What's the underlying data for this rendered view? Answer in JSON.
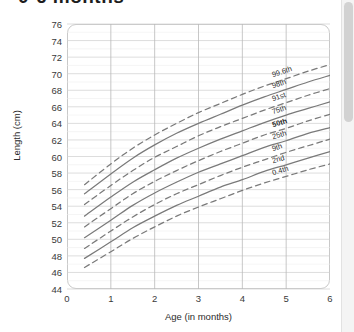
{
  "page": {
    "title": "0-6 months",
    "background_color": "#ffffff"
  },
  "scrollbar": {
    "name": "vertical-scrollbar",
    "thumb_color": "#d2d2d2",
    "track_color": "#f4f4f4"
  },
  "chart_data": {
    "type": "line",
    "title": "0-6 months",
    "xlabel": "Age (in months)",
    "ylabel": "Length (cm)",
    "xlim": [
      0,
      6
    ],
    "ylim": [
      44,
      76
    ],
    "xticks": [
      0,
      1,
      2,
      3,
      4,
      5,
      6
    ],
    "yticks": [
      44,
      46,
      48,
      50,
      52,
      54,
      56,
      58,
      60,
      62,
      64,
      66,
      68,
      70,
      72,
      74,
      76
    ],
    "grid": true,
    "grid_minor_y_step": 1,
    "legend_position": "inline-right-of-curves",
    "line_color": "#7a7a7a",
    "x": [
      0.4,
      1,
      1.5,
      2,
      2.5,
      3,
      3.5,
      4,
      4.5,
      5,
      5.5,
      6
    ],
    "series": [
      {
        "name": "99.6th",
        "label": "99.6th",
        "style": "dashed",
        "values": [
          56.6,
          59.1,
          61.0,
          62.6,
          64.0,
          65.3,
          66.4,
          67.5,
          68.5,
          69.4,
          70.3,
          71.1
        ]
      },
      {
        "name": "98th",
        "label": "98th",
        "style": "solid",
        "values": [
          55.5,
          57.9,
          59.8,
          61.4,
          62.8,
          64.0,
          65.1,
          66.2,
          67.2,
          68.1,
          69.0,
          69.8
        ]
      },
      {
        "name": "91st",
        "label": "91st",
        "style": "dashed",
        "values": [
          54.2,
          56.5,
          58.3,
          59.9,
          61.2,
          62.5,
          63.6,
          64.6,
          65.6,
          66.5,
          67.4,
          68.2
        ]
      },
      {
        "name": "75th",
        "label": "75th",
        "style": "solid",
        "values": [
          52.8,
          55.1,
          56.9,
          58.4,
          59.8,
          61.0,
          62.1,
          63.1,
          64.1,
          65.0,
          65.8,
          66.6
        ]
      },
      {
        "name": "50th",
        "label": "50th",
        "style": "dashed",
        "values": [
          51.5,
          53.7,
          55.5,
          57.0,
          58.3,
          59.5,
          60.6,
          61.6,
          62.6,
          63.4,
          64.3,
          65.1
        ]
      },
      {
        "name": "25th",
        "label": "25th",
        "style": "solid",
        "values": [
          50.2,
          52.3,
          54.1,
          55.6,
          56.9,
          58.1,
          59.1,
          60.1,
          61.1,
          61.9,
          62.8,
          63.5
        ]
      },
      {
        "name": "9th",
        "label": "9th",
        "style": "dashed",
        "values": [
          48.9,
          51.0,
          52.7,
          54.2,
          55.5,
          56.6,
          57.7,
          58.7,
          59.6,
          60.5,
          61.3,
          62.1
        ]
      },
      {
        "name": "2nd",
        "label": "2nd",
        "style": "solid",
        "values": [
          47.7,
          49.7,
          51.4,
          52.8,
          54.1,
          55.2,
          56.3,
          57.2,
          58.2,
          59.0,
          59.8,
          60.6
        ]
      },
      {
        "name": "0.4th",
        "label": "0.4th",
        "style": "dashed",
        "values": [
          46.6,
          48.5,
          50.1,
          51.5,
          52.8,
          53.9,
          54.9,
          55.9,
          56.8,
          57.6,
          58.4,
          59.1
        ]
      }
    ]
  }
}
